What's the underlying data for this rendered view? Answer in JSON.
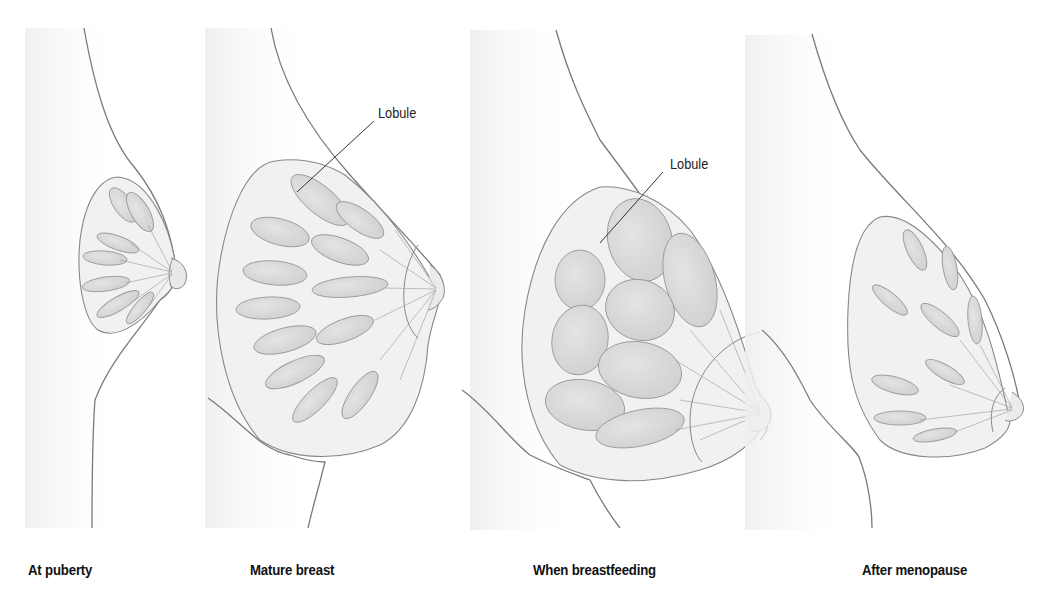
{
  "figure": {
    "panels": [
      {
        "id": "puberty",
        "caption": "At puberty"
      },
      {
        "id": "mature",
        "caption": "Mature breast",
        "callout": "Lobule"
      },
      {
        "id": "breastfeeding",
        "caption": "When breastfeeding",
        "callout": "Lobule"
      },
      {
        "id": "menopause",
        "caption": "After menopause"
      }
    ]
  },
  "colors": {
    "outline": "#7a7a7a",
    "gland_fill": "#d9d9d9",
    "tissue_fill": "#f1f1f1",
    "shadow": "#e6e6e6",
    "text": "#111111"
  }
}
